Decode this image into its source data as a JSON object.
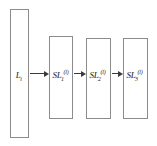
{
  "diagram": {
    "type": "pipeline-flow",
    "background_color": "#ffffff",
    "box_border_color": "#8c8c8c",
    "arrow_color": "#3a3a3a",
    "text_color": "#1a1a1a",
    "nodes": [
      {
        "id": "input-layer",
        "base": "L",
        "sub": "i",
        "sup": "",
        "x": 10,
        "y": 9,
        "width": 19,
        "height": 129,
        "label_cx": 19,
        "label_cy": 73
      },
      {
        "id": "sublayer-1",
        "base": "SL",
        "sub": "1",
        "sup": "(l)",
        "x": 49,
        "y": 36,
        "width": 24,
        "height": 83,
        "label_cx": 61,
        "label_cy": 73
      },
      {
        "id": "sublayer-2",
        "base": "SL",
        "sub": "2",
        "sup": "(l)",
        "x": 86,
        "y": 38,
        "width": 25,
        "height": 81,
        "label_cx": 98,
        "label_cy": 73
      },
      {
        "id": "sublayer-3",
        "base": "SL",
        "sub": "3",
        "sup": "(l)",
        "x": 123,
        "y": 38,
        "width": 25,
        "height": 81,
        "label_cx": 135,
        "label_cy": 73
      }
    ],
    "arrows": [
      {
        "id": "arrow-input-to-sl1",
        "x": 30,
        "y": 73,
        "length": 14
      },
      {
        "id": "arrow-sl1-to-sl2",
        "x": 74,
        "y": 73,
        "length": 7
      },
      {
        "id": "arrow-sl2-to-sl3",
        "x": 112,
        "y": 73,
        "length": 6
      }
    ]
  }
}
